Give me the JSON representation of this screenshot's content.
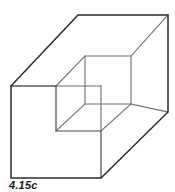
{
  "figure": {
    "caption": "4.15c",
    "colors": {
      "background": "#ffffff",
      "outer_edge": "#2b2b2b",
      "inner_edge": "#6e6e6e",
      "mid_edge": "#4a4a4a",
      "face_fill": "#ffffff",
      "caption_text": "#1a1a1a"
    },
    "canvas": {
      "width": 175,
      "height": 192
    },
    "geometry": {
      "front_face": "11,86 56,86 56,131 101,131 101,178 11,178",
      "top_face": "11,86 78,15 168,15 101,86",
      "right_face": "101,86 168,15 168,112 101,178",
      "notch_top_face": "56,86 85,56 131,56 101,86",
      "notch_back_face": "85,56 131,56 131,104 85,104",
      "notch_floor_face": "56,131 85,104 131,104 101,131",
      "outer_silhouette": "11,86 78,15 168,15 168,112 101,178 11,178 11,86",
      "step_profile": "11,86 56,86 56,131 101,131 101,178",
      "inner_square": "85,56 131,56 131,104 85,104 85,56",
      "connector_upper_left": "56,86 85,56",
      "connector_lower_left": "56,131 85,104",
      "connector_lower_right": "101,131 131,104",
      "connector_front_vertical": "101,86 101,131",
      "top_face_inner_edge": "11,86 101,86",
      "inner_top_right_diagonal": "131,56 168,15",
      "inner_bottom_right_diagonal": "131,104 168,112"
    }
  }
}
